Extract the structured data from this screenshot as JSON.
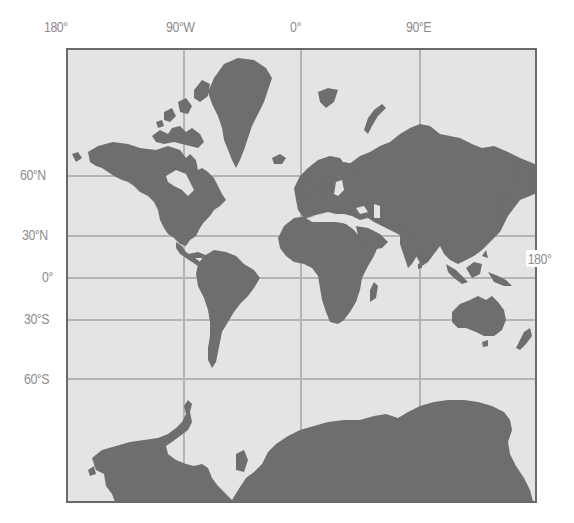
{
  "map": {
    "projection_style": "Mercator world map",
    "colors": {
      "land": "#6e6e6e",
      "ocean": "#e4e4e4",
      "grid": "#b4b4b4",
      "frame": "#6a6a6a",
      "label": "#8c8c8c"
    },
    "longitude_labels": [
      {
        "text": "180°",
        "x": 44,
        "y": 18
      },
      {
        "text": "90°W",
        "x": 166,
        "y": 18
      },
      {
        "text": "0°",
        "x": 290,
        "y": 18
      },
      {
        "text": "90°E",
        "x": 406,
        "y": 18
      }
    ],
    "right_label": {
      "text": "180°",
      "x": 526,
      "y": 250
    },
    "latitude_labels": [
      {
        "text": "60°N",
        "x": 20,
        "y": 166
      },
      {
        "text": "30°N",
        "x": 22,
        "y": 226
      },
      {
        "text": "0°",
        "x": 42,
        "y": 268
      },
      {
        "text": "30°S",
        "x": 24,
        "y": 310
      },
      {
        "text": "60°S",
        "x": 24,
        "y": 370
      }
    ],
    "gridlines": {
      "meridians_x": [
        116,
        233,
        352
      ],
      "parallels_y": [
        126,
        186,
        228,
        270,
        329
      ]
    }
  }
}
